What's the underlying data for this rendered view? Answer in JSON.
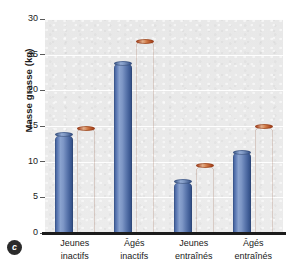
{
  "chart_data": {
    "type": "bar",
    "title": "",
    "subtitle": "",
    "xlabel": "",
    "ylabel": "Masse grasse (kg)",
    "ylim": [
      0,
      30
    ],
    "ytick_values": [
      0,
      5,
      10,
      15,
      20,
      25,
      30
    ],
    "ytick_labels": [
      "0",
      "5",
      "10",
      "15",
      "20",
      "25",
      "30"
    ],
    "grid": true,
    "grid_axis": "y",
    "legend": false,
    "legend_position": "none",
    "categories": [
      "Jeunes inactifs",
      "Âgés inactifs",
      "Jeunes entraînés",
      "Âgés entraînés"
    ],
    "category_lines": [
      [
        "Jeunes",
        "inactifs"
      ],
      [
        "Âgés",
        "inactifs"
      ],
      [
        "Jeunes",
        "entraînés"
      ],
      [
        "Âgés",
        "entraînés"
      ]
    ],
    "series": [
      {
        "name": "series-1",
        "color": "#5d79af",
        "values": [
          13.8,
          23.8,
          7.2,
          11.3
        ]
      },
      {
        "name": "series-2",
        "color": "#c25a2c",
        "values": [
          14.7,
          26.9,
          9.4,
          14.9
        ]
      }
    ],
    "panel_label": "c",
    "plot_background": "#e9e9e9",
    "gridline_color": "#ffffff",
    "axis_color": "#1c1c1c"
  }
}
